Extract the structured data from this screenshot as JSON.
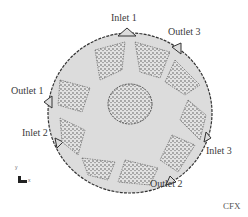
{
  "figure": {
    "labels": {
      "inlet1": "Inlet 1",
      "outlet3": "Outlet 3",
      "outlet1": "Outlet 1",
      "inlet2": "Inlet 2",
      "inlet3": "Inlet 3",
      "outlet2": "Outlet 2"
    },
    "software_tag": "CFX",
    "axis_triad": {
      "y": "y",
      "x": "x"
    },
    "colors": {
      "mesh_fill": "#d9d9d9",
      "mesh_dots": "#3a3a3a",
      "outline": "#333333",
      "background": "#ffffff"
    }
  }
}
